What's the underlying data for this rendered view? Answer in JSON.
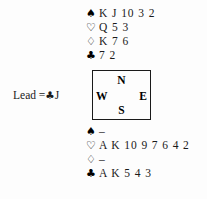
{
  "diagram": {
    "type": "bridge-hand-diagram",
    "background_color": "#fdfdfd",
    "text_color": "#1a1a1a"
  },
  "suits": {
    "spade": {
      "name": "spade-suit-icon",
      "glyph": "♠",
      "fill": "solid"
    },
    "heart": {
      "name": "heart-suit-icon",
      "glyph": "♡",
      "fill": "outline"
    },
    "diamond": {
      "name": "diamond-suit-icon",
      "glyph": "♢",
      "fill": "outline"
    },
    "club": {
      "name": "club-suit-icon",
      "glyph": "♣",
      "fill": "solid"
    }
  },
  "north_hand": {
    "position": "North",
    "spades": "K J 10 3 2",
    "hearts": "Q 5 3",
    "diamonds": "K 7 6",
    "clubs": "7 2"
  },
  "south_hand": {
    "position": "South",
    "spades": "–",
    "hearts": "A K 10 9 7 6 4 2",
    "diamonds": "–",
    "clubs": "A K 5 4 3"
  },
  "compass": {
    "north": "N",
    "west": "W",
    "east": "E",
    "south": "S"
  },
  "lead": {
    "label": "Lead =",
    "suit_glyph": "♣",
    "rank": "J",
    "full_text": "Lead = ♣J"
  }
}
